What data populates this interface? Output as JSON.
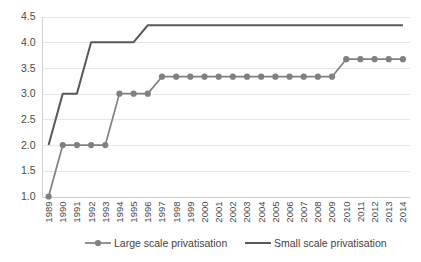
{
  "chart_data": {
    "type": "line",
    "title": "",
    "subtitle": "",
    "xlabel": "",
    "ylabel": "",
    "grid": "horizontal",
    "legend_position": "bottom",
    "ylim": [
      1.0,
      4.5
    ],
    "ytick_step": 0.5,
    "ytick_labels": [
      "4.5",
      "4.0",
      "3.5",
      "3.0",
      "2.5",
      "2.0",
      "1.5",
      "1.0"
    ],
    "ytick_values": [
      4.5,
      4.0,
      3.5,
      3.0,
      2.5,
      2.0,
      1.5,
      1.0
    ],
    "categories": [
      "1989",
      "1990",
      "1991",
      "1992",
      "1993",
      "1994",
      "1995",
      "1996",
      "1997",
      "1998",
      "1999",
      "2000",
      "2001",
      "2002",
      "2003",
      "2004",
      "2005",
      "2006",
      "2007",
      "2008",
      "2009",
      "2010",
      "2011",
      "2012",
      "2013",
      "2014"
    ],
    "series": [
      {
        "name": "Large scale privatisation",
        "color": "#808080",
        "marker": "circle",
        "marker_size": 3.1,
        "line_width": 1.7,
        "values": [
          1.0,
          2.0,
          2.0,
          2.0,
          2.0,
          3.0,
          3.0,
          3.0,
          3.33,
          3.33,
          3.33,
          3.33,
          3.33,
          3.33,
          3.33,
          3.33,
          3.33,
          3.33,
          3.33,
          3.33,
          3.33,
          3.67,
          3.67,
          3.67,
          3.67,
          3.67
        ]
      },
      {
        "name": "Small scale privatisation",
        "color": "#595959",
        "marker": "none",
        "marker_size": 0,
        "line_width": 2.0,
        "values": [
          2.0,
          3.0,
          3.0,
          4.0,
          4.0,
          4.0,
          4.0,
          4.33,
          4.33,
          4.33,
          4.33,
          4.33,
          4.33,
          4.33,
          4.33,
          4.33,
          4.33,
          4.33,
          4.33,
          4.33,
          4.33,
          4.33,
          4.33,
          4.33,
          4.33,
          4.33
        ]
      }
    ],
    "legend": [
      {
        "label": "Large scale privatisation",
        "color": "#808080",
        "marker": "circle"
      },
      {
        "label": "Small scale privatisation",
        "color": "#595959",
        "marker": "none"
      }
    ],
    "colors": {
      "gridline": "#e6e6e6",
      "axis": "#d0d0d0",
      "tick_text": "#4a4a4a",
      "legend_text": "#3f3f3f",
      "background": "#ffffff"
    }
  }
}
